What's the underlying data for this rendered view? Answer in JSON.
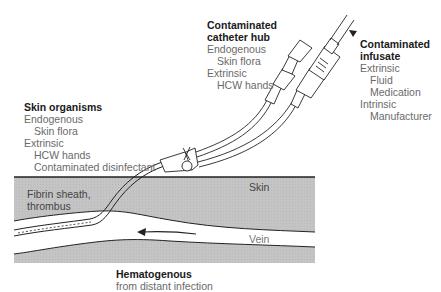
{
  "diagram": {
    "colors": {
      "tissue": "#c4c4c4",
      "vein": "#ffffff",
      "outline": "#222222",
      "title_text": "#1a1a1a",
      "body_text": "#6a6a6a"
    },
    "regions": {
      "skin_label": "Skin",
      "vein_label": "Vein",
      "fibrin_label_line1": "Fibrin sheath,",
      "fibrin_label_line2": "thrombus"
    },
    "sources": {
      "skin_organisms": {
        "title": "Skin organisms",
        "endogenous": "Endogenous",
        "endogenous_item": "Skin flora",
        "extrinsic": "Extrinsic",
        "extrinsic_item1": "HCW hands",
        "extrinsic_item2": "Contaminated disinfectant"
      },
      "catheter_hub": {
        "title_line1": "Contaminated",
        "title_line2": "catheter hub",
        "endogenous": "Endogenous",
        "endogenous_item": "Skin flora",
        "extrinsic": "Extrinsic",
        "extrinsic_item": "HCW hands"
      },
      "infusate": {
        "title_line1": "Contaminated",
        "title_line2": "infusate",
        "extrinsic": "Extrinsic",
        "extrinsic_item1": "Fluid",
        "extrinsic_item2": "Medication",
        "intrinsic": "Intrinsic",
        "intrinsic_item": "Manufacturer"
      },
      "hematogenous": {
        "title": "Hematogenous",
        "detail": "from distant infection"
      }
    }
  }
}
